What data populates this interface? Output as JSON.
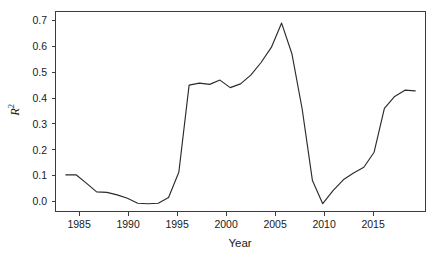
{
  "chart_data": {
    "type": "line",
    "title": "",
    "xlabel": "Year",
    "ylabel": "R2",
    "ylabel_display": "R",
    "ylabel_superscript": "2",
    "xlim": [
      1983.0,
      2019.0
    ],
    "ylim": [
      -0.028,
      0.768
    ],
    "grid": false,
    "legend": null,
    "line_color": "#2b2b2b",
    "background_color": "#ffffff",
    "frame_color": "#3c3c3c",
    "xticks": [
      1985,
      1990,
      1995,
      2000,
      2005,
      2010,
      2015
    ],
    "xtick_labels": [
      "1985",
      "1990",
      "1995",
      "2000",
      "2005",
      "2010",
      "2015"
    ],
    "yticks": [
      0.0,
      0.1,
      0.2,
      0.3,
      0.4,
      0.5,
      0.6,
      0.7
    ],
    "ytick_labels": [
      "0.0",
      "0.1",
      "0.2",
      "0.3",
      "0.4",
      "0.5",
      "0.6",
      "0.7"
    ],
    "x": [
      1984,
      1985,
      1986,
      1987,
      1988,
      1989,
      1990,
      1991,
      1992,
      1993,
      1994,
      1995,
      1996,
      1997,
      1998,
      1999,
      2000,
      2001,
      2002,
      2003,
      2004,
      2005,
      2006,
      2007,
      2008,
      2009,
      2010,
      2011,
      2012,
      2013,
      2014,
      2015,
      2016,
      2017,
      2018
    ],
    "values": [
      0.118,
      0.118,
      0.085,
      0.05,
      0.048,
      0.038,
      0.025,
      0.005,
      0.003,
      0.005,
      0.028,
      0.128,
      0.475,
      0.483,
      0.478,
      0.495,
      0.465,
      0.48,
      0.515,
      0.565,
      0.625,
      0.722,
      0.6,
      0.38,
      0.095,
      0.003,
      0.055,
      0.098,
      0.125,
      0.148,
      0.208,
      0.382,
      0.43,
      0.455,
      0.452
    ],
    "series": [
      {
        "name": "R2",
        "values": [
          0.118,
          0.118,
          0.085,
          0.05,
          0.048,
          0.038,
          0.025,
          0.005,
          0.003,
          0.005,
          0.028,
          0.128,
          0.475,
          0.483,
          0.478,
          0.495,
          0.465,
          0.48,
          0.515,
          0.565,
          0.625,
          0.722,
          0.6,
          0.38,
          0.095,
          0.003,
          0.055,
          0.098,
          0.125,
          0.148,
          0.208,
          0.382,
          0.43,
          0.455,
          0.452
        ]
      }
    ]
  }
}
